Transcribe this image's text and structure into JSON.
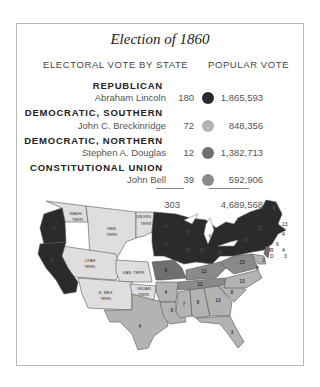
{
  "title": "Election of 1860",
  "headers": {
    "electoral": "ELECTORAL VOTE BY STATE",
    "popular": "POPULAR VOTE"
  },
  "colors": {
    "republican": "#2b2b2b",
    "southern_democrat": "#b5b5b5",
    "northern_democrat": "#7a7a7a",
    "constitutional_union": "#8d8d8d",
    "territory": "#dedede",
    "border": "#555555"
  },
  "candidates": [
    {
      "party": "REPUBLICAN",
      "name": "Abraham Lincoln",
      "electoral": "180",
      "popular": "1,865,593",
      "color": "#2b2b2b"
    },
    {
      "party": "DEMOCRATIC, SOUTHERN",
      "name": "John C. Breckinridge",
      "electoral": "72",
      "popular": "848,356",
      "color": "#b3b3b3"
    },
    {
      "party": "DEMOCRATIC, NORTHERN",
      "name": "Stephen A. Douglas",
      "electoral": "12",
      "popular": "1,382,713",
      "color": "#6f6f6f"
    },
    {
      "party": "CONSTITUTIONAL UNION",
      "name": "John Bell",
      "electoral": "39",
      "popular": "592,906",
      "color": "#8a8a8a"
    }
  ],
  "totals": {
    "electoral": "303",
    "popular": "4,689,568"
  },
  "map": {
    "territory_labels": [
      "WASH. TERR.",
      "NEB. TERR.",
      "UNORG. TERR.",
      "UTAH TERR.",
      "KAN. TERR.",
      "N. MEX. TERR.",
      "INDIAN TERR."
    ],
    "state_votes": [
      "4",
      "4",
      "4",
      "9",
      "13",
      "4",
      "6",
      "4",
      "3",
      "27",
      "27",
      "11",
      "13",
      "6",
      "4",
      "8",
      "3",
      "15",
      "12",
      "12",
      "10",
      "8",
      "7",
      "9",
      "10",
      "6",
      "4",
      "4",
      "3",
      "3",
      "4",
      "3"
    ]
  }
}
